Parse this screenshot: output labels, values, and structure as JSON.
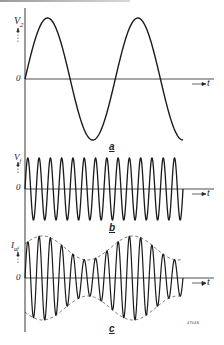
{
  "figure": {
    "reference_number": "47046",
    "time_axis_label": "t",
    "zero_label": "0"
  },
  "panels": [
    {
      "id": "a",
      "label": "a",
      "y_label": "V",
      "y_sub": "2",
      "description": "Low-frequency modulating sine wave"
    },
    {
      "id": "b",
      "label": "b",
      "y_label": "V",
      "y_sub": "f",
      "description": "High-frequency carrier wave, constant amplitude"
    },
    {
      "id": "c",
      "label": "c",
      "y_label": "I",
      "y_sub": "af",
      "description": "Amplitude-modulated carrier with dashed envelope"
    }
  ],
  "chart_data": [
    {
      "type": "line",
      "title": "a",
      "ylabel": "V2",
      "xlabel": "t",
      "series": [
        {
          "name": "V2",
          "shape": "sine",
          "cycles": 1.75,
          "amplitude": 1.0,
          "phase_start": "zero-rising"
        }
      ],
      "grid": false
    },
    {
      "type": "line",
      "title": "b",
      "ylabel": "Vf",
      "xlabel": "t",
      "series": [
        {
          "name": "Vf",
          "shape": "sine",
          "cycles": 14,
          "amplitude": 1.0,
          "phase_start": "zero-rising"
        }
      ],
      "grid": false
    },
    {
      "type": "line",
      "title": "c",
      "ylabel": "Iaf",
      "xlabel": "t",
      "series": [
        {
          "name": "Iaf",
          "shape": "AM carrier",
          "carrier_cycles": 14,
          "modulation_cycles": 1.75,
          "modulation_depth": 0.4
        },
        {
          "name": "envelope",
          "style": "dashed",
          "max_amplitude": 1.0,
          "min_amplitude": 0.43
        }
      ],
      "grid": false
    }
  ]
}
